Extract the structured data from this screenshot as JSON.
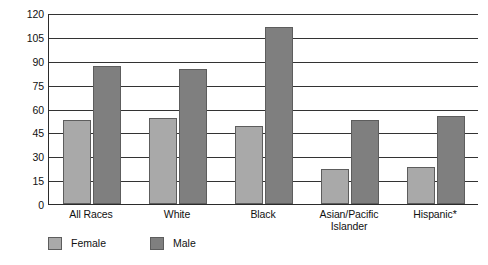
{
  "chart_data": {
    "type": "bar",
    "title": "",
    "subtitle": "",
    "xlabel": "",
    "ylabel": "",
    "categories": [
      "All Races",
      "White",
      "Black",
      "Asian/Pacific Islander",
      "Hispanic*"
    ],
    "series": [
      {
        "name": "Female",
        "color": "#a9a9a9",
        "values": [
          53,
          54,
          49,
          22,
          23
        ]
      },
      {
        "name": "Male",
        "color": "#7f7f7f",
        "values": [
          87,
          85,
          111,
          53,
          55
        ]
      }
    ],
    "ylim": [
      0,
      120
    ],
    "ytick_step": 15,
    "yticks": [
      120,
      105,
      90,
      75,
      60,
      45,
      30,
      15,
      0
    ],
    "ytick_labels": [
      "120",
      "105",
      "90",
      "75",
      "60",
      "45",
      "30",
      "15",
      "0"
    ],
    "grid": true,
    "grid_axis": "y",
    "legend": {
      "position": "bottom-left",
      "entries": [
        {
          "label": "Female",
          "color": "#a9a9a9"
        },
        {
          "label": "Male",
          "color": "#7f7f7f"
        }
      ]
    },
    "category_label_lines": [
      [
        "All Races"
      ],
      [
        "White"
      ],
      [
        "Black"
      ],
      [
        "Asian/Pacific",
        "Islander"
      ],
      [
        "Hispanic*"
      ]
    ],
    "annotations": [
      "*"
    ],
    "background_color": "#ffffff",
    "axis_color": "#2b2b2b"
  }
}
